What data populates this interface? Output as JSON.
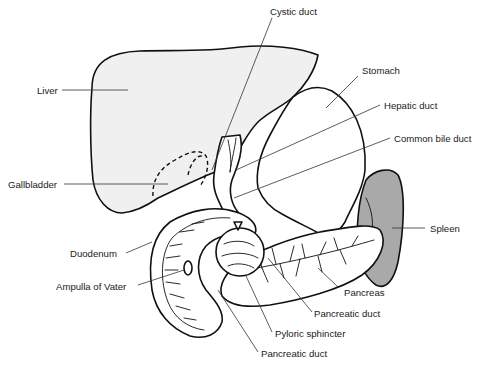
{
  "diagram": {
    "colors": {
      "liver_fill": "#f0f0f0",
      "spleen_fill": "#a9a9a9",
      "outline": "#111111",
      "background": "#ffffff"
    },
    "labels": {
      "cystic_duct": "Cystic duct",
      "liver": "Liver",
      "stomach": "Stomach",
      "hepatic_duct": "Hepatic duct",
      "common_bile_duct": "Common bile duct",
      "gallbladder": "Gallbladder",
      "spleen": "Spleen",
      "duodenum": "Duodenum",
      "ampulla_of_vater": "Ampulla of Vater",
      "pancreas": "Pancreas",
      "pancreatic_duct_right": "Pancreatic duct",
      "pyloric_sphincter": "Pyloric sphincter",
      "pancreatic_duct_bottom": "Pancreatic duct"
    }
  }
}
